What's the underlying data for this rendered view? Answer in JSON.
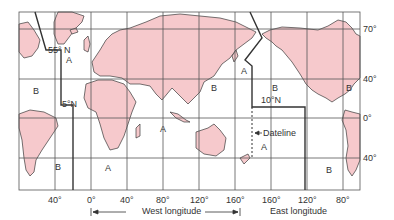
{
  "map": {
    "colors": {
      "land": "#f6c9cc",
      "coast": "#3a3a3a",
      "grid": "#555555",
      "boundary": "#333333",
      "sea": "#ffffff"
    },
    "lat_labels": [
      "70°",
      "40°",
      "0°",
      "40°"
    ],
    "lon_labels": [
      "40°",
      "0°",
      "40°",
      "80°",
      "120°",
      "160°",
      "160°",
      "120°",
      "80°"
    ],
    "zones": {
      "z1": "55° N",
      "z1a": "A",
      "z2": "B",
      "z3": "5°N",
      "z4": "B",
      "z5": "A",
      "z6": "B",
      "z7": "A",
      "z8": "A",
      "z9": "B",
      "z10": "10°N",
      "z11": "B",
      "z12": "A",
      "z13": "B"
    },
    "dateline_label": "Dateline",
    "west_label": "West longitude",
    "east_label": "East longitude"
  }
}
